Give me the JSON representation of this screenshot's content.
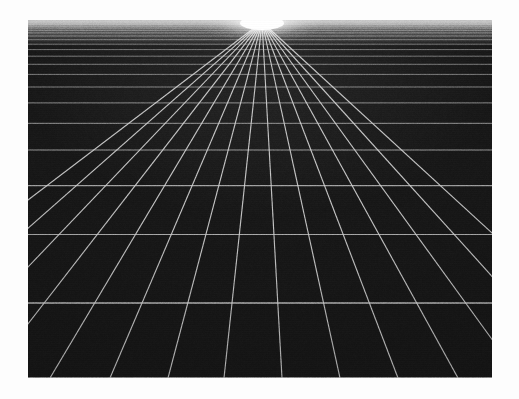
{
  "artwork": {
    "title": "One-Point Perspective Grid",
    "subject": "infinite-grid-plane",
    "medium": "halftone print",
    "caption": ""
  },
  "canvas": {
    "width": 519,
    "height": 399,
    "paper_color": "#fdfdfd"
  },
  "plate": {
    "left": 28,
    "top": 20,
    "width": 464,
    "height": 358,
    "background_color": "#171717",
    "line_color": "#d2d2d2",
    "glow_color": "#ffffff"
  },
  "chart_data": {
    "type": "scatter",
    "title": "One-Point Perspective Grid",
    "subtitle": "Ground plane receding to a single vanishing point",
    "xlabel": "",
    "ylabel": "",
    "grid": true,
    "legend": "none",
    "vanishing_point": {
      "x": 262,
      "y": 22
    },
    "horizon_y": 22,
    "plate_bounds": {
      "x0": 28,
      "y0": 20,
      "x1": 492,
      "y1": 378
    },
    "radial_line_count": 15,
    "horizontal_line_count": 22,
    "radial_lines_bottom_x": [
      -206,
      -142,
      -78,
      -14,
      50,
      110,
      168,
      224,
      282,
      340,
      398,
      458,
      520,
      584,
      650
    ],
    "horizontal_lines_y": [
      22.0,
      23.2,
      24.6,
      26.2,
      28.1,
      30.3,
      32.9,
      36.0,
      39.7,
      44.2,
      49.6,
      56.2,
      64.3,
      74.4,
      87.0,
      102.9,
      123.3,
      149.9,
      185.6,
      234.5,
      303.0,
      378.0
    ],
    "x": [],
    "values": []
  }
}
